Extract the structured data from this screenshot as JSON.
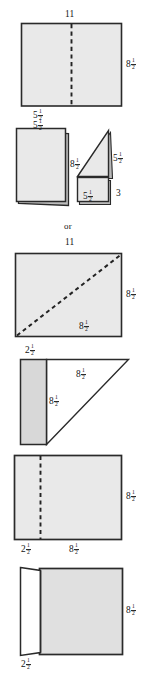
{
  "page": {
    "background_color": "#ffffff",
    "ink_color": "#141414",
    "paper_fill": "#e6e6e6",
    "paper_fill_light": "#ffffff",
    "connector_word": "or"
  },
  "figures": [
    {
      "id": "figure-1-full-sheet-vertical-fold",
      "name": "full-sheet-with-vertical-fold-line",
      "description": "Rectangle with dashed vertical fold line at the middle",
      "labels": {
        "top": {
          "text": "11",
          "whole": "11",
          "numerator": "",
          "denominator": ""
        },
        "right": {
          "text": "8 1/2",
          "whole": "8",
          "numerator": "1",
          "denominator": "2"
        },
        "bottom": {
          "text": "5 1/2",
          "whole": "5",
          "numerator": "1",
          "denominator": "2"
        }
      }
    },
    {
      "id": "figure-2a-folded-half-sheet",
      "name": "folded-half-sheet",
      "description": "Folded sheet shown as stacked rectangle",
      "labels": {
        "top": {
          "text": "5 1/2",
          "whole": "5",
          "numerator": "1",
          "denominator": "2"
        },
        "right": {
          "text": "8 1/2",
          "whole": "8",
          "numerator": "1",
          "denominator": "2"
        }
      }
    },
    {
      "id": "figure-2b-triangle-on-rectangle",
      "name": "triangle-over-rectangle-stack",
      "description": "Triangle resting on top of a rectangle, folded paper",
      "labels": {
        "triangle_right": {
          "text": "5 1/2",
          "whole": "5",
          "numerator": "1",
          "denominator": "2"
        },
        "rectangle_right": {
          "text": "3",
          "whole": "3",
          "numerator": "",
          "denominator": ""
        },
        "bottom": {
          "text": "5 1/2",
          "whole": "5",
          "numerator": "1",
          "denominator": "2"
        }
      }
    },
    {
      "id": "figure-3-sheet-diagonal-fold",
      "name": "full-sheet-with-diagonal-fold-line",
      "description": "Rectangle with dashed diagonal fold line from bottom-left to top-right",
      "labels": {
        "top": {
          "text": "11",
          "whole": "11",
          "numerator": "",
          "denominator": ""
        },
        "right": {
          "text": "8 1/2",
          "whole": "8",
          "numerator": "1",
          "denominator": "2"
        },
        "diagonal": {
          "text": "8 1/2",
          "whole": "8",
          "numerator": "1",
          "denominator": "2"
        }
      }
    },
    {
      "id": "figure-4-strip-and-triangle",
      "name": "narrow-strip-with-right-triangle",
      "description": "Shaded narrow strip on the left with an unshaded right triangle beside it",
      "labels": {
        "top_left": {
          "text": "2 1/2",
          "whole": "2",
          "numerator": "1",
          "denominator": "2"
        },
        "triangle_top": {
          "text": "8 1/2",
          "whole": "8",
          "numerator": "1",
          "denominator": "2"
        },
        "triangle_vertical": {
          "text": "8 1/2",
          "whole": "8",
          "numerator": "1",
          "denominator": "2"
        }
      }
    },
    {
      "id": "figure-5-sheet-offset-fold",
      "name": "full-sheet-with-offset-vertical-fold-line",
      "description": "Rectangle with dashed vertical fold line offset from the left edge",
      "labels": {
        "right": {
          "text": "8 1/2",
          "whole": "8",
          "numerator": "1",
          "denominator": "2"
        },
        "bottom_left": {
          "text": "2 1/2",
          "whole": "2",
          "numerator": "1",
          "denominator": "2"
        },
        "bottom_right": {
          "text": "8 1/2",
          "whole": "8",
          "numerator": "1",
          "denominator": "2"
        }
      }
    },
    {
      "id": "figure-6-sheet-with-flap",
      "name": "sheet-with-folded-flap",
      "description": "Shaded sheet with a white folded flap standing on the left edge",
      "labels": {
        "right": {
          "text": "8 1/2",
          "whole": "8",
          "numerator": "1",
          "denominator": "2"
        },
        "bottom_left": {
          "text": "2 1/2",
          "whole": "2",
          "numerator": "1",
          "denominator": "2"
        }
      }
    }
  ]
}
